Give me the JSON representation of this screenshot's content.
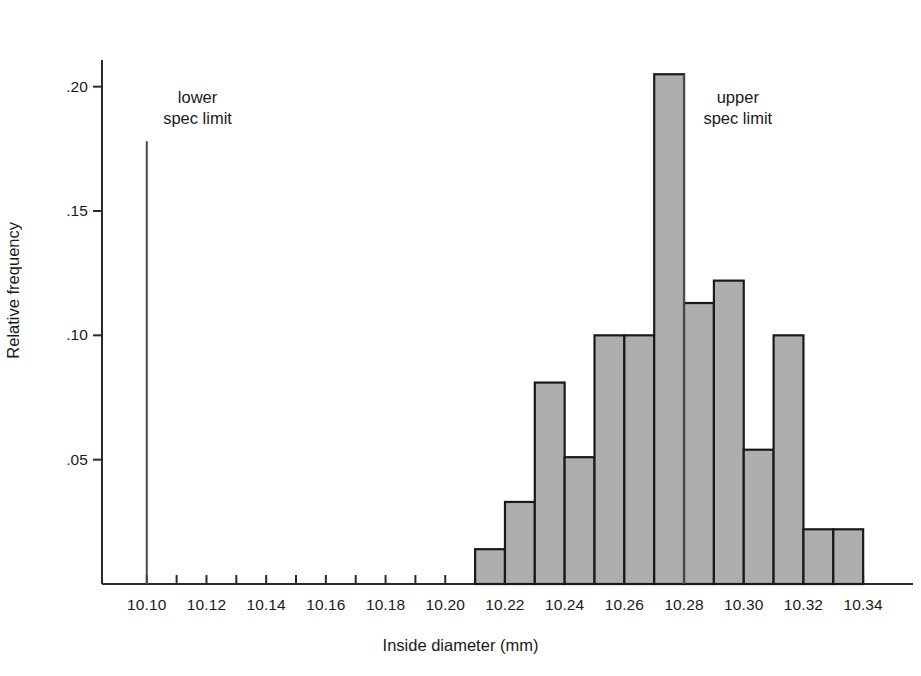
{
  "chart_data": {
    "type": "bar",
    "title": "",
    "subtitle": "",
    "xlabel": "Inside diameter (mm)",
    "ylabel": "Relative frequency",
    "xlim": [
      10.085,
      10.35
    ],
    "ylim": [
      0,
      0.215
    ],
    "grid": false,
    "legend": null,
    "bin_width": 0.01,
    "categories": [
      "10.21",
      "10.22",
      "10.23",
      "10.24",
      "10.25",
      "10.26",
      "10.27",
      "10.28",
      "10.29",
      "10.30",
      "10.31",
      "10.32",
      "10.33"
    ],
    "bin_starts": [
      10.21,
      10.22,
      10.23,
      10.24,
      10.25,
      10.26,
      10.27,
      10.28,
      10.29,
      10.3,
      10.31,
      10.32,
      10.33
    ],
    "values": [
      0.014,
      0.033,
      0.081,
      0.051,
      0.1,
      0.1,
      0.205,
      0.113,
      0.122,
      0.054,
      0.1,
      0.022,
      0.022
    ],
    "xticks": [
      10.1,
      10.11,
      10.12,
      10.13,
      10.14,
      10.15,
      10.16,
      10.17,
      10.18,
      10.19,
      10.2,
      10.21,
      10.22,
      10.23,
      10.24,
      10.25,
      10.26,
      10.27,
      10.28,
      10.29,
      10.3,
      10.31,
      10.32,
      10.33,
      10.34
    ],
    "xtick_labels": [
      {
        "value": 10.1,
        "text": "10.10"
      },
      {
        "value": 10.12,
        "text": "10.12"
      },
      {
        "value": 10.14,
        "text": "10.14"
      },
      {
        "value": 10.16,
        "text": "10.16"
      },
      {
        "value": 10.18,
        "text": "10.18"
      },
      {
        "value": 10.2,
        "text": "10.20"
      },
      {
        "value": 10.22,
        "text": "10.22"
      },
      {
        "value": 10.24,
        "text": "10.24"
      },
      {
        "value": 10.26,
        "text": "10.26"
      },
      {
        "value": 10.28,
        "text": "10.28"
      },
      {
        "value": 10.3,
        "text": "10.30"
      },
      {
        "value": 10.32,
        "text": "10.32"
      },
      {
        "value": 10.34,
        "text": "10.34"
      }
    ],
    "ytick_labels": [
      {
        "value": 0.05,
        "text": ".05"
      },
      {
        "value": 0.1,
        "text": ".10"
      },
      {
        "value": 0.15,
        "text": ".15"
      },
      {
        "value": 0.2,
        "text": ".20"
      }
    ],
    "annotations": [
      {
        "name": "lower-spec-limit",
        "line1": "lower",
        "line2": "spec limit",
        "x": 10.1,
        "label_x": 10.117,
        "label_y": 0.196,
        "line_top": 0.178
      },
      {
        "name": "upper-spec-limit",
        "line1": "upper",
        "line2": "spec limit",
        "x": 10.28,
        "label_x": 10.298,
        "label_y": 0.196,
        "line_top": 0.205
      }
    ],
    "colors": {
      "bar_fill": "#aeaeae",
      "bar_edge": "#1a1a1a",
      "axis": "#2a2a2a",
      "spec_line": "#4a4a4a",
      "text": "#1a1a1a",
      "background": "#ffffff"
    }
  }
}
